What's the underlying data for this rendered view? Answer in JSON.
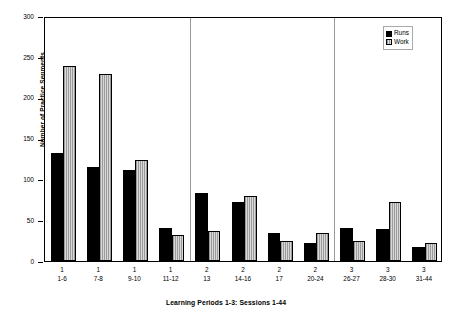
{
  "chart_data": {
    "type": "bar",
    "title": "",
    "xlabel": "Learning Periods 1-3: Sessions 1-44",
    "ylabel": "Number of Practice Segments",
    "ylim": [
      0,
      300
    ],
    "yticks": [
      0,
      50,
      100,
      150,
      200,
      250,
      300
    ],
    "ytick_labels": [
      "0",
      "50",
      "100",
      "150",
      "200",
      "250",
      "300"
    ],
    "grid": false,
    "legend_position": "top-right",
    "legend": [
      "Runs",
      "Work"
    ],
    "categories": [
      "1\n1-6",
      "1\n7-8",
      "1\n9-10",
      "1\n11-12",
      "2\n13",
      "2\n14-16",
      "2\n17",
      "2\n20-24",
      "3\n26-27",
      "3\n28-30",
      "3\n31-44"
    ],
    "group_labels": [
      {
        "period": "1",
        "sessions": "1-6"
      },
      {
        "period": "1",
        "sessions": "7-8"
      },
      {
        "period": "1",
        "sessions": "9-10"
      },
      {
        "period": "1",
        "sessions": "11-12"
      },
      {
        "period": "2",
        "sessions": "13"
      },
      {
        "period": "2",
        "sessions": "14-16"
      },
      {
        "period": "2",
        "sessions": "17"
      },
      {
        "period": "2",
        "sessions": "20-24"
      },
      {
        "period": "3",
        "sessions": "26-27"
      },
      {
        "period": "3",
        "sessions": "28-30"
      },
      {
        "period": "3",
        "sessions": "31-44"
      }
    ],
    "series": [
      {
        "name": "Runs",
        "color": "#000000",
        "values": [
          132,
          115,
          112,
          40,
          83,
          72,
          34,
          22,
          40,
          39,
          17
        ]
      },
      {
        "name": "Work",
        "color": "#b3b3b3",
        "values": [
          239,
          229,
          124,
          32,
          37,
          80,
          25,
          34,
          25,
          72,
          22
        ]
      }
    ],
    "period_dividers": [
      4,
      8
    ]
  }
}
